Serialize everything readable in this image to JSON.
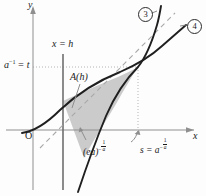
{
  "figure": {
    "background": "#fdfdfd",
    "ink": "#1b1b1b",
    "shade_fill": "#b9b9b9",
    "dash_color": "#9a9a9a",
    "dot_color": "#b0b0b0"
  },
  "axes": {
    "x_label": "x",
    "y_label": "y",
    "origin_label": "O"
  },
  "labels": {
    "vertical_line": "x = h",
    "area": "A(h)",
    "y_intercept_base": "a",
    "y_intercept_exp": "−1",
    "y_intercept_eq": "= t",
    "lower_point_base": "(ea)",
    "lower_point_exp_minus": "−",
    "lower_point_exp_num": "1",
    "lower_point_exp_den": "a",
    "s_point_lead": "s = ",
    "s_point_base": "a",
    "s_point_exp_minus": "−",
    "s_point_exp_num": "1",
    "s_point_exp_den": "a"
  },
  "curves": [
    {
      "id": "3",
      "badge": "③",
      "digit": "3",
      "style": "solid",
      "role": "tangent-line-steeper-branch"
    },
    {
      "id": "4",
      "badge": "④",
      "digit": "4",
      "style": "solid",
      "role": "exponential-curve"
    }
  ],
  "guides": {
    "horizontal_dotted_at": "a^-1 = t",
    "vertical_dotted_at": "s = a^(-1/a)",
    "vertical_solid_at": "x = h"
  },
  "geometry": {
    "origin_px": [
      33,
      130
    ],
    "x_axis_y_px": 130,
    "y_axis_x_px": 33,
    "h_line_x_px": 63,
    "s_line_x_px": 138,
    "t_line_y_px": 67,
    "tangency_px": [
      138,
      67
    ]
  }
}
